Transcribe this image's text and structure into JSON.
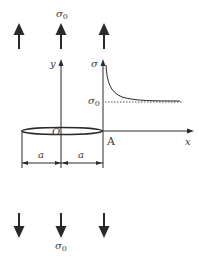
{
  "figure": {
    "type": "crack-under-remote-tension",
    "stress_label_top": "σ0",
    "stress_label_bottom": "σ0",
    "axis_y_label": "y",
    "axis_sigma_label": "σ",
    "axis_x_label": "x",
    "origin_label": "O",
    "point_A_label": "A",
    "sigma0_level_label": "σ0",
    "half_length_left_label": "a",
    "half_length_right_label": "a",
    "top_arrows_count": 3,
    "bottom_arrows_count": 3,
    "colors": {
      "line": "#2a2a2a",
      "text": "#3a3a3a",
      "background": "#ffffff"
    }
  }
}
